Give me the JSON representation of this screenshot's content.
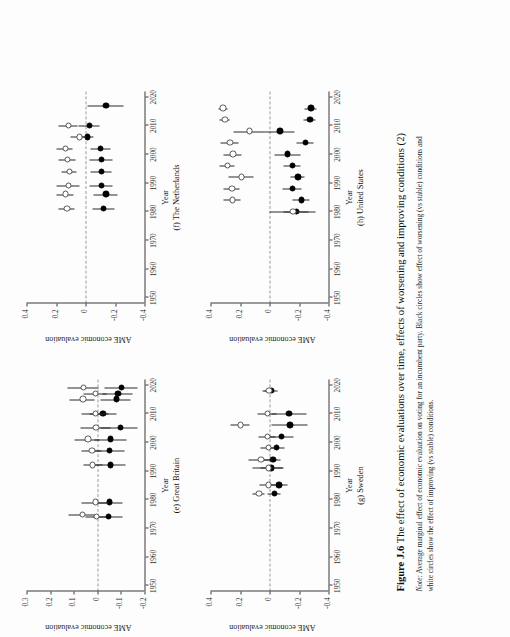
{
  "figure": {
    "caption_label": "Figure J.6",
    "caption_title": "The effect of economic evaluations over time, effects of worsening and improving conditions (2)",
    "note_label": "Note:",
    "note_text": "Average marginal effect of economic evaluation on voting for an incumbent party. Black circles show effect of worsening (vs stable) conditions and white circles show the effect of improving (vs stable) conditions."
  },
  "axes": {
    "xlabel": "Year",
    "ylabel": "AME economic evaluation",
    "xticks": [
      "1950",
      "1960",
      "1970",
      "1980",
      "1990",
      "2000",
      "2010",
      "2020"
    ],
    "yticks_04": [
      "0.4",
      "0.2",
      "0",
      "-0.2",
      "-0.4"
    ],
    "yticks_03": [
      "0.3",
      "0.2",
      "0.1",
      "0",
      "-0.1",
      "-0.2"
    ]
  },
  "legend": {
    "black_circle": "worsening (vs stable) conditions",
    "white_circle": "improving (vs stable) conditions"
  },
  "chart_data": [
    {
      "id": "panel-e",
      "type": "scatter",
      "title": "(e) Great Britain",
      "xlabel": "Year",
      "ylabel": "AME economic evaluation",
      "xlim": [
        1948,
        2022
      ],
      "ylim": [
        -0.2,
        0.3
      ],
      "yticks": [
        0.3,
        0.2,
        0.1,
        0,
        -0.1,
        -0.2
      ],
      "xticks": [
        1950,
        1960,
        1970,
        1980,
        1990,
        2000,
        2010,
        2020
      ],
      "grid": false,
      "zero_reference_line": 0,
      "series": [
        {
          "name": "worsening (vs stable) conditions",
          "marker": "black-circle",
          "points": [
            {
              "x": 1974,
              "y": -0.045,
              "lo": -0.105,
              "hi": 0.015
            },
            {
              "x": 1979,
              "y": -0.05,
              "lo": -0.105,
              "hi": 0.01
            },
            {
              "x": 1992,
              "y": -0.055,
              "lo": -0.12,
              "hi": 0.01
            },
            {
              "x": 1997,
              "y": -0.05,
              "lo": -0.115,
              "hi": 0.012
            },
            {
              "x": 2001,
              "y": -0.055,
              "lo": -0.125,
              "hi": 0.01
            },
            {
              "x": 2005,
              "y": -0.095,
              "lo": -0.17,
              "hi": -0.015
            },
            {
              "x": 2010,
              "y": -0.022,
              "lo": -0.08,
              "hi": 0.035
            },
            {
              "x": 2015,
              "y": -0.078,
              "lo": -0.14,
              "hi": -0.015
            },
            {
              "x": 2017,
              "y": -0.085,
              "lo": -0.15,
              "hi": -0.02
            },
            {
              "x": 2019,
              "y": -0.1,
              "lo": -0.17,
              "hi": -0.03
            }
          ]
        },
        {
          "name": "improving (vs stable) conditions",
          "marker": "white-circle",
          "points": [
            {
              "x": 1974,
              "y": 0.005,
              "lo": -0.04,
              "hi": 0.05
            },
            {
              "x": 1974.8,
              "y": 0.065,
              "lo": 0.012,
              "hi": 0.12
            },
            {
              "x": 1979,
              "y": 0.01,
              "lo": -0.048,
              "hi": 0.068
            },
            {
              "x": 1992,
              "y": 0.022,
              "lo": -0.02,
              "hi": 0.06
            },
            {
              "x": 1997,
              "y": 0.025,
              "lo": -0.018,
              "hi": 0.068
            },
            {
              "x": 2001,
              "y": 0.042,
              "lo": -0.01,
              "hi": 0.095
            },
            {
              "x": 2005,
              "y": 0.008,
              "lo": -0.055,
              "hi": 0.072
            },
            {
              "x": 2010,
              "y": 0.01,
              "lo": -0.048,
              "hi": 0.068
            },
            {
              "x": 2015,
              "y": 0.062,
              "lo": 0.01,
              "hi": 0.118
            },
            {
              "x": 2017,
              "y": 0.01,
              "lo": -0.04,
              "hi": 0.058
            },
            {
              "x": 2019,
              "y": 0.06,
              "lo": -0.005,
              "hi": 0.125
            }
          ]
        }
      ]
    },
    {
      "id": "panel-f",
      "type": "scatter",
      "title": "(f) The Netherlands",
      "xlabel": "Year",
      "ylabel": "AME economic evaluation",
      "xlim": [
        1948,
        2022
      ],
      "ylim": [
        -0.4,
        0.4
      ],
      "yticks": [
        0.4,
        0.2,
        0,
        -0.2,
        -0.4
      ],
      "xticks": [
        1950,
        1960,
        1970,
        1980,
        1990,
        2000,
        2010,
        2020
      ],
      "grid": false,
      "zero_reference_line": 0,
      "series": [
        {
          "name": "worsening (vs stable) conditions",
          "marker": "black-circle",
          "points": [
            {
              "x": 1981,
              "y": -0.12,
              "lo": -0.195,
              "hi": -0.045
            },
            {
              "x": 1986,
              "y": -0.135,
              "lo": -0.215,
              "hi": -0.055
            },
            {
              "x": 1989,
              "y": -0.105,
              "lo": -0.18,
              "hi": -0.03
            },
            {
              "x": 1994,
              "y": -0.105,
              "lo": -0.175,
              "hi": -0.035
            },
            {
              "x": 1998,
              "y": -0.105,
              "lo": -0.18,
              "hi": -0.03
            },
            {
              "x": 2002,
              "y": -0.1,
              "lo": -0.17,
              "hi": -0.032
            },
            {
              "x": 2006,
              "y": -0.01,
              "lo": -0.055,
              "hi": 0.032
            },
            {
              "x": 2010,
              "y": -0.022,
              "lo": -0.092,
              "hi": 0.048
            },
            {
              "x": 2017,
              "y": -0.135,
              "lo": -0.255,
              "hi": -0.012
            }
          ]
        },
        {
          "name": "improving (vs stable) conditions",
          "marker": "white-circle",
          "points": [
            {
              "x": 1981,
              "y": 0.13,
              "lo": 0.072,
              "hi": 0.185
            },
            {
              "x": 1986,
              "y": 0.138,
              "lo": 0.078,
              "hi": 0.2
            },
            {
              "x": 1989,
              "y": 0.118,
              "lo": 0.042,
              "hi": 0.195
            },
            {
              "x": 1994,
              "y": 0.112,
              "lo": 0.06,
              "hi": 0.165
            },
            {
              "x": 1998,
              "y": 0.125,
              "lo": 0.065,
              "hi": 0.182
            },
            {
              "x": 2002,
              "y": 0.14,
              "lo": 0.085,
              "hi": 0.198
            },
            {
              "x": 2006,
              "y": 0.045,
              "lo": -0.01,
              "hi": 0.1
            },
            {
              "x": 2010,
              "y": 0.118,
              "lo": 0.055,
              "hi": 0.18
            }
          ]
        }
      ]
    },
    {
      "id": "panel-g",
      "type": "scatter",
      "title": "(g) Sweden",
      "xlabel": "Year",
      "ylabel": "AME economic evaluation",
      "xlim": [
        1948,
        2022
      ],
      "ylim": [
        -0.4,
        0.4
      ],
      "yticks": [
        0.4,
        0.2,
        0,
        -0.2,
        -0.4
      ],
      "xticks": [
        1950,
        1960,
        1970,
        1980,
        1990,
        2000,
        2010,
        2020
      ],
      "grid": false,
      "zero_reference_line": 0,
      "series": [
        {
          "name": "worsening (vs stable) conditions",
          "marker": "black-circle",
          "points": [
            {
              "x": 1982,
              "y": -0.032,
              "lo": -0.075,
              "hi": 0.012
            },
            {
              "x": 1985,
              "y": -0.062,
              "lo": -0.125,
              "hi": 0.0
            },
            {
              "x": 1991,
              "y": -0.012,
              "lo": -0.09,
              "hi": 0.062
            },
            {
              "x": 1994,
              "y": -0.02,
              "lo": -0.075,
              "hi": 0.038
            },
            {
              "x": 1998,
              "y": -0.045,
              "lo": -0.1,
              "hi": 0.01
            },
            {
              "x": 2002,
              "y": -0.078,
              "lo": -0.16,
              "hi": 0.002
            },
            {
              "x": 2006,
              "y": -0.135,
              "lo": -0.255,
              "hi": -0.012
            },
            {
              "x": 2010,
              "y": -0.13,
              "lo": -0.25,
              "hi": -0.012
            },
            {
              "x": 2018,
              "y": -0.01,
              "lo": -0.055,
              "hi": 0.035
            }
          ]
        },
        {
          "name": "improving (vs stable) conditions",
          "marker": "white-circle",
          "points": [
            {
              "x": 1982,
              "y": 0.075,
              "lo": 0.032,
              "hi": 0.118
            },
            {
              "x": 1985,
              "y": 0.012,
              "lo": -0.04,
              "hi": 0.065
            },
            {
              "x": 1991,
              "y": 0.01,
              "lo": -0.095,
              "hi": 0.112
            },
            {
              "x": 1994,
              "y": 0.06,
              "lo": -0.02,
              "hi": 0.14
            },
            {
              "x": 1998,
              "y": 0.012,
              "lo": -0.04,
              "hi": 0.062
            },
            {
              "x": 2002,
              "y": 0.018,
              "lo": -0.038,
              "hi": 0.072
            },
            {
              "x": 2006,
              "y": 0.2,
              "lo": 0.135,
              "hi": 0.262
            },
            {
              "x": 2010,
              "y": 0.015,
              "lo": -0.05,
              "hi": 0.082
            },
            {
              "x": 2018,
              "y": 0.008,
              "lo": -0.028,
              "hi": 0.045
            }
          ]
        }
      ]
    },
    {
      "id": "panel-h",
      "type": "scatter",
      "title": "(h) United States",
      "xlabel": "Year",
      "ylabel": "AME economic evaluation",
      "xlim": [
        1948,
        2022
      ],
      "ylim": [
        -0.4,
        0.4
      ],
      "yticks": [
        0.4,
        0.2,
        0,
        -0.2,
        -0.4
      ],
      "xticks": [
        1950,
        1960,
        1970,
        1980,
        1990,
        2000,
        2010,
        2020
      ],
      "grid": false,
      "zero_reference_line": 0,
      "series": [
        {
          "name": "worsening (vs stable) conditions",
          "marker": "black-circle",
          "points": [
            {
              "x": 1980,
              "y": -0.178,
              "lo": -0.262,
              "hi": -0.092
            },
            {
              "x": 1984,
              "y": -0.215,
              "lo": -0.272,
              "hi": -0.158
            },
            {
              "x": 1988,
              "y": -0.152,
              "lo": -0.215,
              "hi": -0.09
            },
            {
              "x": 1992,
              "y": -0.19,
              "lo": -0.238,
              "hi": -0.142
            },
            {
              "x": 1996,
              "y": -0.152,
              "lo": -0.212,
              "hi": -0.092
            },
            {
              "x": 2000,
              "y": -0.118,
              "lo": -0.208,
              "hi": -0.032
            },
            {
              "x": 2004,
              "y": -0.242,
              "lo": -0.3,
              "hi": -0.185
            },
            {
              "x": 2008,
              "y": -0.068,
              "lo": -0.168,
              "hi": 0.03
            },
            {
              "x": 2012,
              "y": -0.272,
              "lo": -0.312,
              "hi": -0.232
            },
            {
              "x": 2016,
              "y": -0.278,
              "lo": -0.32,
              "hi": -0.238
            }
          ]
        },
        {
          "name": "improving (vs stable) conditions",
          "marker": "white-circle",
          "points": [
            {
              "x": 1980,
              "y": -0.155,
              "lo": -0.31,
              "hi": 0.0
            },
            {
              "x": 1984,
              "y": 0.255,
              "lo": 0.198,
              "hi": 0.312
            },
            {
              "x": 1988,
              "y": 0.258,
              "lo": 0.2,
              "hi": 0.315
            },
            {
              "x": 1992,
              "y": 0.195,
              "lo": 0.11,
              "hi": 0.28
            },
            {
              "x": 1996,
              "y": 0.288,
              "lo": 0.235,
              "hi": 0.34
            },
            {
              "x": 2000,
              "y": 0.252,
              "lo": 0.188,
              "hi": 0.315
            },
            {
              "x": 2004,
              "y": 0.272,
              "lo": 0.212,
              "hi": 0.332
            },
            {
              "x": 2008,
              "y": 0.138,
              "lo": 0.03,
              "hi": 0.245
            },
            {
              "x": 2012,
              "y": 0.305,
              "lo": 0.268,
              "hi": 0.342
            },
            {
              "x": 2016,
              "y": 0.318,
              "lo": 0.288,
              "hi": 0.348
            }
          ]
        }
      ]
    }
  ]
}
